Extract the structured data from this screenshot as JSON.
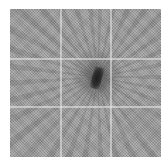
{
  "image": {
    "description": "Grayscale textured square with a faint 3x3 grid and a dark radial burst near the center",
    "alt": "Grayscale noisy texture with dark central spot and radiating streaks",
    "colors": {
      "background": "#9a9a9a",
      "core": "#1e1e1e",
      "gridline": "#ebebeb"
    }
  }
}
